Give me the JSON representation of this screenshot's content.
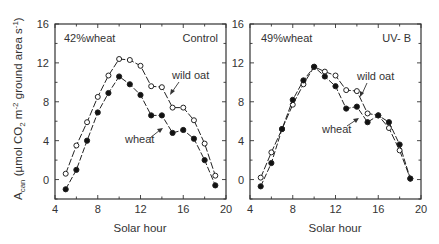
{
  "chart_data": [
    {
      "type": "line",
      "panel_label": "Control",
      "annotation": "42% wheat",
      "title": "",
      "xlabel": "Solar hour",
      "ylabel": "Acan (µmol CO2 m-2 ground area s-1)",
      "xlim": [
        4,
        20
      ],
      "ylim": [
        -2,
        16
      ],
      "xticks": [
        4,
        8,
        12,
        16,
        20
      ],
      "yticks": [
        0,
        4,
        8,
        12,
        16
      ],
      "grid": false,
      "x": [
        5,
        6,
        7,
        8,
        9,
        10,
        11,
        12,
        13,
        14,
        15,
        16,
        17,
        18,
        19
      ],
      "series": [
        {
          "name": "wild oat",
          "marker": "open-circle",
          "values": [
            0.6,
            3.5,
            5.9,
            8.5,
            10.7,
            12.4,
            12.3,
            11.7,
            9.6,
            9.5,
            7.4,
            7.4,
            6.1,
            3.7,
            0.4
          ]
        },
        {
          "name": "wheat",
          "marker": "filled-circle",
          "values": [
            -1.0,
            1.0,
            4.0,
            6.9,
            8.9,
            10.6,
            9.8,
            8.7,
            6.6,
            6.6,
            4.8,
            5.1,
            4.2,
            2.0,
            -0.6
          ]
        }
      ],
      "labels": {
        "wild_oat": "wild oat",
        "wheat": "wheat"
      }
    },
    {
      "type": "line",
      "panel_label": "UV- B",
      "annotation": "49% wheat",
      "title": "",
      "xlabel": "Solar hour",
      "ylabel": "",
      "xlim": [
        4,
        20
      ],
      "ylim": [
        -2,
        16
      ],
      "xticks": [
        4,
        8,
        12,
        16,
        20
      ],
      "yticks": [
        0,
        4,
        8,
        12,
        16
      ],
      "grid": false,
      "x": [
        5,
        6,
        7,
        8,
        9,
        10,
        11,
        12,
        13,
        14,
        15,
        16,
        17,
        18,
        19
      ],
      "series": [
        {
          "name": "wild oat",
          "marker": "open-circle",
          "values": [
            0.2,
            2.8,
            5.2,
            7.7,
            9.8,
            11.6,
            11.1,
            10.7,
            9.2,
            9.1,
            6.8,
            6.6,
            5.3,
            3.0,
            0.1
          ]
        },
        {
          "name": "wheat",
          "marker": "filled-circle",
          "values": [
            -0.7,
            1.7,
            5.2,
            8.2,
            10.2,
            11.6,
            10.6,
            9.6,
            7.3,
            7.5,
            5.9,
            6.6,
            5.9,
            3.6,
            0.1
          ]
        }
      ],
      "labels": {
        "wild_oat": "wild oat",
        "wheat": "wheat"
      }
    }
  ],
  "text": {
    "ylabel_main": "A",
    "ylabel_sub": "can",
    "ylabel_rest": " (µmol CO",
    "ylabel_co2sub": "2",
    "ylabel_m": " m",
    "ylabel_msup": "-2",
    "ylabel_ground": " ground area s",
    "ylabel_ssup": "-1",
    "ylabel_close": ")",
    "xlabel_left": "Solar hour",
    "xlabel_right": "Solar hour",
    "left_annotation": "42%wheat",
    "left_panel": "Control",
    "right_annotation": "49%wheat",
    "right_panel": "UV- B",
    "left_wild_oat": "wild oat",
    "left_wheat": "wheat",
    "right_wild_oat": "wild oat",
    "right_wheat": "wheat"
  },
  "colors": {
    "ink": "#222222",
    "frame": "#333333",
    "background": "#ffffff"
  }
}
